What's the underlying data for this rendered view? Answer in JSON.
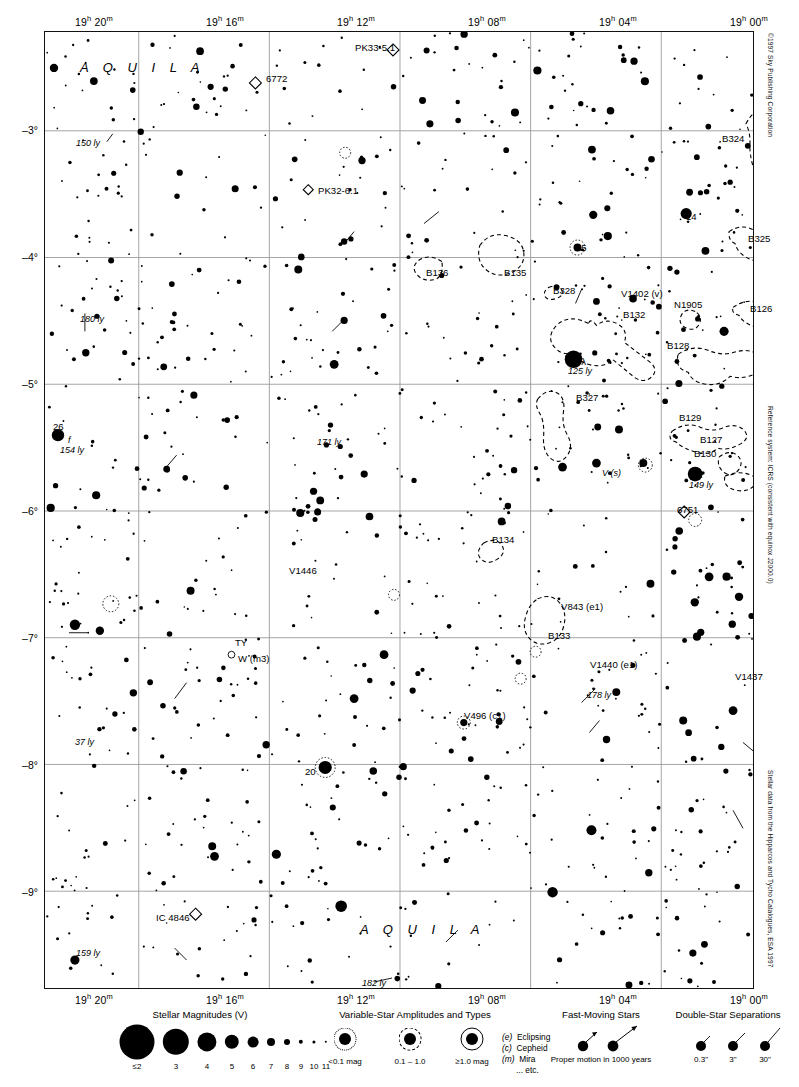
{
  "chart_data": {
    "type": "scatter",
    "xlabel": "Right Ascension (J2000)",
    "ylabel": "Declination",
    "xlim": [
      "19h 22m",
      "18h 59m"
    ],
    "ylim": [
      -9.6,
      -2.35
    ],
    "grid": true,
    "legend_position": "bottom",
    "ra_ticks": [
      {
        "label": "19h 20m",
        "hours": 19,
        "minutes": 20
      },
      {
        "label": "19h 16m",
        "hours": 19,
        "minutes": 16
      },
      {
        "label": "19h 12m",
        "hours": 19,
        "minutes": 12
      },
      {
        "label": "19h 08m",
        "hours": 19,
        "minutes": 8
      },
      {
        "label": "19h 04m",
        "hours": 19,
        "minutes": 4
      },
      {
        "label": "19h 00m",
        "hours": 19,
        "minutes": 0
      }
    ],
    "dec_ticks": [
      {
        "label": "-3°",
        "value": -3
      },
      {
        "label": "-4°",
        "value": -4
      },
      {
        "label": "-5°",
        "value": -5
      },
      {
        "label": "-6°",
        "value": -6
      },
      {
        "label": "-7°",
        "value": -7
      },
      {
        "label": "-8°",
        "value": -8
      },
      {
        "label": "-9°",
        "value": -9
      }
    ],
    "constellation_labels": [
      "AQUILA",
      "AQUILA"
    ],
    "object_labels": [
      "PK33-5.1",
      "6772",
      "PK32-6.1",
      "14",
      "15",
      "B136",
      "B135",
      "B328",
      "V1402 (v)",
      "B132",
      "N1905",
      "B324",
      "B325",
      "B126",
      "B128",
      "16 λ",
      "125 ly",
      "B327",
      "B129",
      "B127",
      "B130",
      "12",
      "149 ly",
      "26",
      "154 ly",
      "V (s)",
      "6751",
      "B134",
      "171 ly",
      "V1446",
      "V843 (e1)",
      "B133",
      "TY",
      "W (m3)",
      "V1440 (e1)",
      "178 ly",
      "V1437",
      "V496 (c1)",
      "20",
      "150 ly",
      "180 ly",
      "37 ly",
      "IC 4846",
      "159 ly",
      "182 ly"
    ],
    "magnitude_scale": [
      "≤2",
      "3",
      "4",
      "5",
      "6",
      "7",
      "8",
      "9",
      "10",
      "11"
    ]
  },
  "header": {
    "chart_number": "1317",
    "next_chart": "1341"
  },
  "axes": {
    "ra_top": [
      "19h 20m",
      "19h 16m",
      "19h 12m",
      "19h 08m",
      "19h 04m",
      "19h 00m"
    ],
    "ra_bottom": [
      "19h 20m",
      "19h 16m",
      "19h 12m",
      "19h 08m",
      "19h 04m",
      "19h 00m"
    ],
    "ra_parts": [
      {
        "h": "19",
        "hs": "h",
        "m": "20",
        "ms": "m"
      },
      {
        "h": "19",
        "hs": "h",
        "m": "16",
        "ms": "m"
      },
      {
        "h": "19",
        "hs": "h",
        "m": "12",
        "ms": "m"
      },
      {
        "h": "19",
        "hs": "h",
        "m": "08",
        "ms": "m"
      },
      {
        "h": "19",
        "hs": "h",
        "m": "04",
        "ms": "m"
      },
      {
        "h": "19",
        "hs": "h",
        "m": "00",
        "ms": "m"
      }
    ],
    "dec": [
      "–3°",
      "–4°",
      "–5°",
      "–6°",
      "–7°",
      "–8°",
      "–9°"
    ]
  },
  "side_credits": [
    "©1997 Sky Publishing Corporation",
    "Reference system: ICRS (consistent with equinox J2000.0)",
    "Stellar data from the Hipparcos and Tycho Catalogues, ESA 1997"
  ],
  "map_labels": {
    "constellation_top": "A Q U I L A",
    "constellation_bottom": "A Q U I L A",
    "items": [
      {
        "text": "PK33-5.1",
        "x": 355,
        "y": 43,
        "style": "plain"
      },
      {
        "text": "6772",
        "x": 266,
        "y": 74,
        "style": "plain"
      },
      {
        "text": "PK32-6.1",
        "x": 318,
        "y": 186,
        "style": "plain"
      },
      {
        "text": "150 ly",
        "x": 76,
        "y": 139,
        "style": "ital"
      },
      {
        "text": "180 ly",
        "x": 80,
        "y": 315,
        "style": "ital"
      },
      {
        "text": "14",
        "x": 686,
        "y": 212,
        "style": "plain"
      },
      {
        "text": "15",
        "x": 576,
        "y": 243,
        "style": "plain"
      },
      {
        "text": "B136",
        "x": 426,
        "y": 268,
        "style": "plain"
      },
      {
        "text": "B135",
        "x": 504,
        "y": 268,
        "style": "plain"
      },
      {
        "text": "B328",
        "x": 553,
        "y": 286,
        "style": "plain"
      },
      {
        "text": "V1402 (v)",
        "x": 621,
        "y": 289,
        "style": "plain"
      },
      {
        "text": "B132",
        "x": 623,
        "y": 310,
        "style": "plain"
      },
      {
        "text": "N1905",
        "x": 674,
        "y": 300,
        "style": "plain"
      },
      {
        "text": "B324",
        "x": 722,
        "y": 134,
        "style": "plain"
      },
      {
        "text": "B325",
        "x": 748,
        "y": 234,
        "style": "plain"
      },
      {
        "text": "B126",
        "x": 750,
        "y": 304,
        "style": "plain"
      },
      {
        "text": "B128",
        "x": 667,
        "y": 341,
        "style": "plain"
      },
      {
        "text": "16 λ",
        "x": 568,
        "y": 357,
        "style": "plain"
      },
      {
        "text": "125 ly",
        "x": 568,
        "y": 367,
        "style": "ital"
      },
      {
        "text": "B327",
        "x": 576,
        "y": 393,
        "style": "plain"
      },
      {
        "text": "B129",
        "x": 679,
        "y": 413,
        "style": "plain"
      },
      {
        "text": "B127",
        "x": 700,
        "y": 435,
        "style": "plain"
      },
      {
        "text": "B130",
        "x": 694,
        "y": 449,
        "style": "plain"
      },
      {
        "text": "12",
        "x": 692,
        "y": 470,
        "style": "plain"
      },
      {
        "text": "149 ly",
        "x": 689,
        "y": 481,
        "style": "ital"
      },
      {
        "text": "26",
        "x": 53,
        "y": 422,
        "style": "plain"
      },
      {
        "text": "f",
        "x": 68,
        "y": 436,
        "style": "ital"
      },
      {
        "text": "154 ly",
        "x": 60,
        "y": 446,
        "style": "ital"
      },
      {
        "text": "171 ly",
        "x": 317,
        "y": 438,
        "style": "ital"
      },
      {
        "text": "V (s)",
        "x": 602,
        "y": 469,
        "style": "ital"
      },
      {
        "text": "6751",
        "x": 677,
        "y": 505,
        "style": "plain"
      },
      {
        "text": "B134",
        "x": 492,
        "y": 535,
        "style": "plain"
      },
      {
        "text": "V1446",
        "x": 289,
        "y": 566,
        "style": "plain"
      },
      {
        "text": "V843 (e1)",
        "x": 561,
        "y": 602,
        "style": "plain"
      },
      {
        "text": "B133",
        "x": 548,
        "y": 631,
        "style": "plain"
      },
      {
        "text": "TY",
        "x": 235,
        "y": 638,
        "style": "plain"
      },
      {
        "text": "W (m3)",
        "x": 238,
        "y": 654,
        "style": "plain"
      },
      {
        "text": "V1440 (e1)",
        "x": 590,
        "y": 660,
        "style": "plain"
      },
      {
        "text": "178 ly",
        "x": 587,
        "y": 691,
        "style": "ital"
      },
      {
        "text": "V1437",
        "x": 735,
        "y": 672,
        "style": "plain"
      },
      {
        "text": "V496 (c1)",
        "x": 464,
        "y": 711,
        "style": "plain"
      },
      {
        "text": "20",
        "x": 305,
        "y": 767,
        "style": "plain"
      },
      {
        "text": "37 ly",
        "x": 75,
        "y": 738,
        "style": "ital"
      },
      {
        "text": "IC 4846",
        "x": 156,
        "y": 913,
        "style": "plain"
      },
      {
        "text": "159 ly",
        "x": 76,
        "y": 949,
        "style": "ital"
      },
      {
        "text": "182 ly",
        "x": 362,
        "y": 979,
        "style": "ital"
      }
    ]
  },
  "legend": {
    "magnitudes": {
      "title": "Stellar Magnitudes (V)",
      "labels": [
        "≤2",
        "3",
        "4",
        "5",
        "6",
        "7",
        "8",
        "9",
        "10",
        "11"
      ]
    },
    "variables": {
      "title": "Variable-Star Amplitudes and Types",
      "amplitudes": [
        "<0.1 mag",
        "0.1 – 1.0",
        "≥1.0 mag"
      ],
      "types": [
        {
          "code": "(e)",
          "name": "Eclipsing"
        },
        {
          "code": "(c)",
          "name": "Cepheid"
        },
        {
          "code": "(m)",
          "name": "Mira"
        },
        {
          "code": "",
          "name": "... etc."
        }
      ]
    },
    "fast_moving": {
      "title": "Fast-Moving Stars",
      "caption": "Proper motion in 1000 years"
    },
    "doubles": {
      "title": "Double-Star Separations",
      "labels": [
        "0.3\"",
        "3\"",
        "30\""
      ]
    }
  },
  "colors": {
    "ink": "#000000",
    "grid": "#9a9a9a",
    "frame": "#111111",
    "paper": "#ffffff"
  }
}
